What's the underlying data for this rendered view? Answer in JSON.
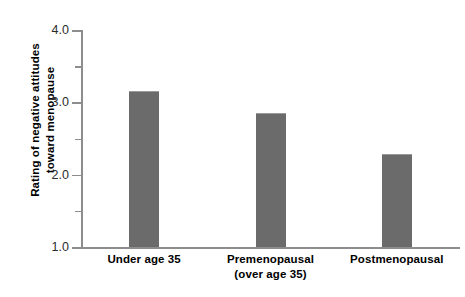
{
  "chart_data": {
    "type": "bar",
    "title": "",
    "subtitle": "",
    "xlabel": "",
    "ylabel": "Rating of negative attitudes toward menopause",
    "ylabel_lines": [
      "Rating of negative attitudes",
      "toward menopause"
    ],
    "categories": [
      "Under age 35",
      "Premenopausal (over age 35)",
      "Postmenopausal"
    ],
    "category_lines": [
      [
        "Under age 35"
      ],
      [
        "Premenopausal",
        "(over age 35)"
      ],
      [
        "Postmenopausal"
      ]
    ],
    "values": [
      3.15,
      2.85,
      2.28
    ],
    "ylim": [
      1.0,
      4.0
    ],
    "yticks": [
      1.0,
      2.0,
      3.0,
      4.0
    ],
    "ytick_labels": [
      "1.0",
      "2.0",
      "3.0",
      "4.0"
    ],
    "yminor_ticks": [
      1.5,
      2.5,
      3.5
    ],
    "grid": false,
    "legend": null,
    "legend_position": "none",
    "bar_color": "#6b6b6b",
    "axis_color": "#8d8d8d",
    "text_color": "#000000",
    "background_color": "#ffffff"
  }
}
